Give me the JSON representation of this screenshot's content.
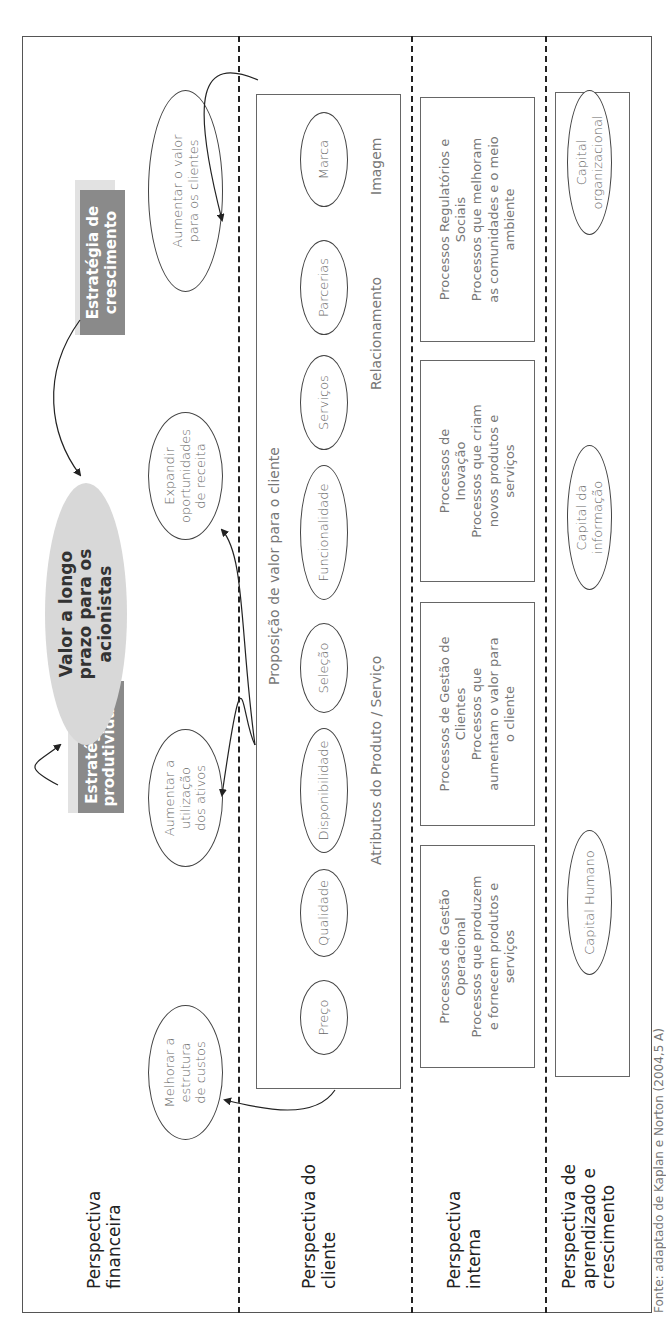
{
  "diagram": {
    "caption": "Fonte: adaptado de Kaplan e Norton (2004,5 A)",
    "colors": {
      "strategy_box": "#8a8a8a",
      "strategy_shadow": "#e2e2e2",
      "value_ellipse": "#d8d8d8",
      "dashed_line": "#222222",
      "border": "#555555"
    },
    "perspectives": {
      "financial": {
        "label_line1": "Perspectiva",
        "label_line2": "financeira"
      },
      "customer": {
        "label_line1": "Perspectiva do",
        "label_line2": "cliente"
      },
      "internal": {
        "label_line1": "Perspectiva",
        "label_line2": "interna"
      },
      "learning": {
        "label_line1": "Perspectiva de",
        "label_line2": "aprendizado e",
        "label_line3": "crescimento"
      }
    },
    "financial": {
      "goal": {
        "line1": "Valor a longo",
        "line2": "prazo para os",
        "line3": "acionistas"
      },
      "productivity_strategy": {
        "line1": "Estratégia de",
        "line2": "produtividade"
      },
      "growth_strategy": {
        "line1": "Estratégia de",
        "line2": "crescimento"
      },
      "objectives": [
        {
          "line1": "Melhorar a estrutura",
          "line2": "de custos"
        },
        {
          "line1": "Aumentar a utilização",
          "line2": "dos ativos"
        },
        {
          "line1": "Expandir",
          "line2": "oportunidades",
          "line3": "de receita"
        },
        {
          "line1": "Aumentar o valor",
          "line2": "para os clientes"
        }
      ]
    },
    "customer": {
      "value_proposition_label": "Proposição de valor para o cliente",
      "attributes": [
        "Preço",
        "Qualidade",
        "Disponibilidade",
        "Seleção",
        "Funcionalidade"
      ],
      "relationship": [
        "Serviços",
        "Parcerias"
      ],
      "image": [
        "Marca"
      ],
      "group_labels": {
        "attributes": "Atributos do Produto / Serviço",
        "relationship": "Relacionamento",
        "image": "Imagem"
      }
    },
    "internal": {
      "processes": [
        {
          "title1": "Processos de Gestão",
          "title2": "Operacional",
          "desc1": "Processos que produzem",
          "desc2": "e fornecem produtos e",
          "desc3": "serviços"
        },
        {
          "title1": "Processos de Gestão de",
          "title2": "Clientes",
          "desc1": "Processos que",
          "desc2": "aumentam o valor para",
          "desc3": "o cliente"
        },
        {
          "title1": "Processos de",
          "title2": "Inovação",
          "desc1": "Processos que criam",
          "desc2": "novos produtos e",
          "desc3": "serviços"
        },
        {
          "title1": "Processos Regulatórios e",
          "title2": "Sociais",
          "desc1": "Processos que melhoram",
          "desc2": "as comunidades e o meio",
          "desc3": "ambiente"
        }
      ]
    },
    "learning": {
      "capitals": [
        {
          "line1": "Capital Humano",
          "line2": ""
        },
        {
          "line1": "Capital da",
          "line2": "informação"
        },
        {
          "line1": "Capital",
          "line2": "organizacional"
        }
      ]
    }
  }
}
